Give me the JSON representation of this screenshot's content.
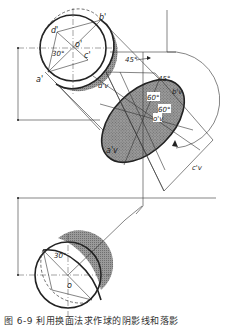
{
  "figure": {
    "type": "descriptive-geometry shadow construction of a sphere",
    "colors": {
      "line": "#222222",
      "shade": "#8c8c8c",
      "background": "#ffffff"
    },
    "labels": {
      "top_view": {
        "a": "a'",
        "b": "b'",
        "c": "c'",
        "d": "d'",
        "o": "o'",
        "angle": "30°"
      },
      "ellipse": {
        "a": "a'v",
        "b": "b'v",
        "c": "c'v",
        "d": "d'v",
        "o": "o'v",
        "angle_45_top": "45°",
        "angle_45_right": "45°",
        "angle_60_a": "60°",
        "angle_60_b": "60°"
      },
      "bottom_view": {
        "o": "o",
        "angle": "30°"
      },
      "dim_m_top": "m",
      "dim_m_bottom": "m"
    },
    "caption": "图 6-9 利用换面法求作球的阴影线和落影"
  }
}
